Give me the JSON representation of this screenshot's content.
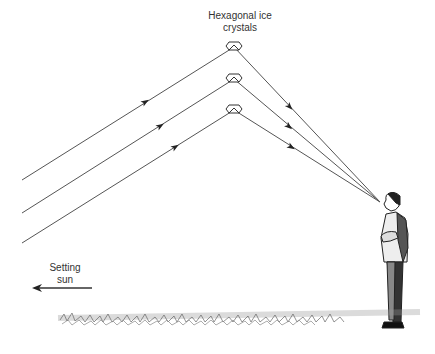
{
  "diagram": {
    "labels": {
      "crystals_line1": "Hexagonal ice",
      "crystals_line2": "crystals",
      "sun_line1": "Setting",
      "sun_line2": "sun"
    },
    "elements": {
      "crystals": [
        {
          "name": "crystal-1",
          "x": 234,
          "y": 47
        },
        {
          "name": "crystal-2",
          "x": 234,
          "y": 79
        },
        {
          "name": "crystal-3",
          "x": 234,
          "y": 110
        }
      ],
      "incoming_rays": [
        {
          "from": [
            22,
            180
          ],
          "to": [
            234,
            47
          ]
        },
        {
          "from": [
            22,
            213
          ],
          "to": [
            234,
            79
          ]
        },
        {
          "from": [
            22,
            243
          ],
          "to": [
            234,
            110
          ]
        }
      ],
      "reflected_rays_converge_at": [
        380,
        202
      ],
      "observer": "man standing with arms crossed looking up",
      "ground": "grass strip",
      "sun_direction_arrow": "left"
    },
    "colors": {
      "line": "#444444",
      "text": "#333333",
      "background": "#ffffff"
    }
  }
}
